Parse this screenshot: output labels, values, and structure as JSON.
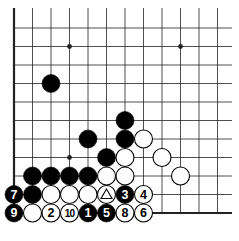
{
  "diagram": {
    "type": "go-board-fragment",
    "grid": {
      "columns": 12,
      "rows": 11,
      "origin_x": 14,
      "spacing": 18.5,
      "bottom_y": 213,
      "edges": [
        "left",
        "bottom"
      ]
    },
    "colors": {
      "line": "#222222",
      "black_stone": "#000000",
      "white_stone": "#ffffff",
      "background": "#ffffff"
    },
    "star_points": [
      {
        "col": 3,
        "row": 1
      },
      {
        "col": 9,
        "row": 1
      },
      {
        "col": 3,
        "row": 7
      },
      {
        "col": 8,
        "row": 7
      }
    ],
    "stones": [
      {
        "col": 2,
        "row": 3,
        "color": "black",
        "label": ""
      },
      {
        "col": 6,
        "row": 5,
        "color": "black",
        "label": ""
      },
      {
        "col": 4,
        "row": 6,
        "color": "black",
        "label": ""
      },
      {
        "col": 6,
        "row": 6,
        "color": "black",
        "label": ""
      },
      {
        "col": 7,
        "row": 6,
        "color": "white",
        "label": ""
      },
      {
        "col": 5,
        "row": 7,
        "color": "black",
        "label": ""
      },
      {
        "col": 6,
        "row": 7,
        "color": "white",
        "label": ""
      },
      {
        "col": 8,
        "row": 7,
        "color": "white",
        "label": ""
      },
      {
        "col": 1,
        "row": 8,
        "color": "black",
        "label": ""
      },
      {
        "col": 2,
        "row": 8,
        "color": "black",
        "label": ""
      },
      {
        "col": 3,
        "row": 8,
        "color": "black",
        "label": ""
      },
      {
        "col": 4,
        "row": 8,
        "color": "black",
        "label": ""
      },
      {
        "col": 5,
        "row": 8,
        "color": "white",
        "label": ""
      },
      {
        "col": 6,
        "row": 8,
        "color": "white",
        "label": ""
      },
      {
        "col": 9,
        "row": 8,
        "color": "white",
        "label": ""
      },
      {
        "col": 0,
        "row": 9,
        "color": "black",
        "label": "7"
      },
      {
        "col": 1,
        "row": 9,
        "color": "black",
        "label": ""
      },
      {
        "col": 2,
        "row": 9,
        "color": "white",
        "label": ""
      },
      {
        "col": 3,
        "row": 9,
        "color": "white",
        "label": ""
      },
      {
        "col": 4,
        "row": 9,
        "color": "white",
        "label": ""
      },
      {
        "col": 5,
        "row": 9,
        "color": "white",
        "label": "",
        "mark": "triangle"
      },
      {
        "col": 6,
        "row": 9,
        "color": "black",
        "label": "3"
      },
      {
        "col": 7,
        "row": 9,
        "color": "white",
        "label": "4"
      },
      {
        "col": 0,
        "row": 10,
        "color": "black",
        "label": "9"
      },
      {
        "col": 1,
        "row": 10,
        "color": "white",
        "label": ""
      },
      {
        "col": 2,
        "row": 10,
        "color": "white",
        "label": "2"
      },
      {
        "col": 3,
        "row": 10,
        "color": "white",
        "label": "10"
      },
      {
        "col": 4,
        "row": 10,
        "color": "black",
        "label": "1"
      },
      {
        "col": 5,
        "row": 10,
        "color": "black",
        "label": "5"
      },
      {
        "col": 6,
        "row": 10,
        "color": "white",
        "label": "8"
      },
      {
        "col": 7,
        "row": 10,
        "color": "white",
        "label": "6"
      }
    ]
  }
}
